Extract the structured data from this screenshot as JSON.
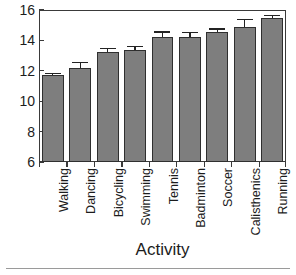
{
  "chart_data": {
    "type": "bar",
    "title": "",
    "subtitle": "",
    "xlabel": "Activity",
    "ylabel": "",
    "categories": [
      "Walking",
      "Dancing",
      "Bicycling",
      "Swimming",
      "Tennis",
      "Badminton",
      "Soccer",
      "Calisthenics",
      "Running"
    ],
    "values": [
      11.75,
      12.2,
      13.25,
      13.4,
      14.2,
      14.2,
      14.55,
      14.9,
      15.45
    ],
    "errors": [
      0.1,
      0.4,
      0.25,
      0.25,
      0.4,
      0.35,
      0.25,
      0.5,
      0.25
    ],
    "series": [
      {
        "name": "Activity value",
        "values": [
          11.75,
          12.2,
          13.25,
          13.4,
          14.2,
          14.2,
          14.55,
          14.9,
          15.45
        ]
      }
    ],
    "ylim": [
      6,
      16
    ],
    "yticks": [
      6,
      8,
      10,
      12,
      14,
      16
    ],
    "ytick_labels": [
      "6",
      "8",
      "10",
      "12",
      "14",
      "16"
    ],
    "grid": false,
    "legend": "none",
    "bar_color": "#7e7e7e",
    "bar_edge_color": "#2f2f2f",
    "error_bar_color": "#232323",
    "axis_color": "#3a3a3a",
    "text_color": "#1c1c1c",
    "background": "#ffffff",
    "xtick_rotation": -90
  }
}
